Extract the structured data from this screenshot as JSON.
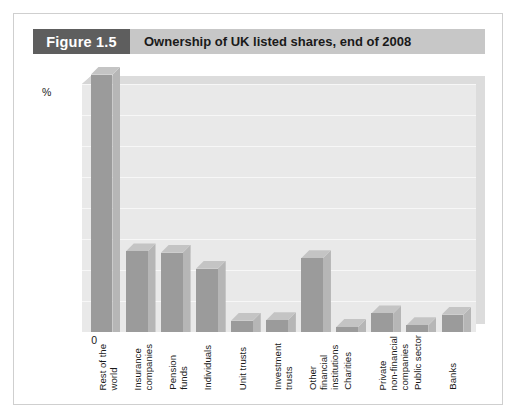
{
  "figure": {
    "number_label": "Figure 1.5",
    "title": "Ownership of UK listed shares, end of 2008"
  },
  "chart_data": {
    "type": "bar",
    "title": "Ownership of UK listed shares, end of 2008",
    "xlabel": "",
    "ylabel": "%",
    "ylim": [
      0,
      40
    ],
    "yticks": [
      0,
      5,
      10,
      15,
      20,
      25,
      30,
      35,
      40
    ],
    "grid": true,
    "legend": "none",
    "style": "3d-bars",
    "categories": [
      "Rest of the world",
      "Insurance companies",
      "Pension funds",
      "Individuals",
      "Unit trusts",
      "Investment trusts",
      "Other financial institutions",
      "Charities",
      "Private non-financial companies",
      "Public sector",
      "Banks"
    ],
    "values": [
      41.5,
      13.0,
      12.8,
      10.2,
      1.8,
      1.9,
      11.9,
      0.8,
      3.0,
      1.1,
      2.8
    ]
  },
  "colors": {
    "figure_number_band": "#5e5e5e",
    "title_band": "#c7c7c7",
    "bar_front": "#9b9b9b",
    "bar_side": "#b6b6b6",
    "bar_top": "#c4c4c4",
    "plot_background": "#e9e9e9",
    "gridline": "#f7f7f7",
    "card_border": "#cfcfcf"
  }
}
